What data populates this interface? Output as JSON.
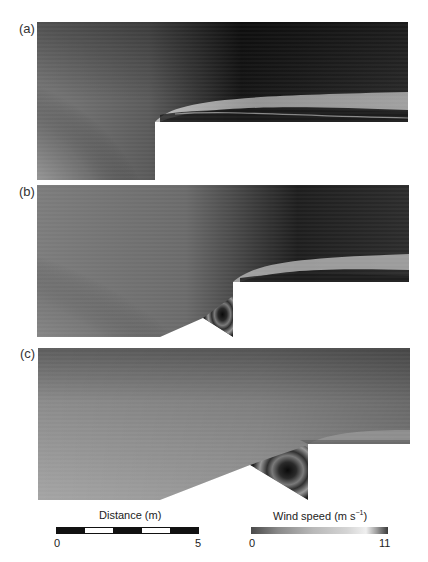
{
  "figure": {
    "panels": [
      {
        "label": "(a)",
        "description": "Wind speed field over a forward-facing step (cliff)"
      },
      {
        "label": "(b)",
        "description": "Wind speed field over step with small ramp and recirculating triangular cavity"
      },
      {
        "label": "(c)",
        "description": "Wind speed field over step with longer ramp and larger triangular recirculation cavity"
      }
    ],
    "scale_bar": {
      "title": "Distance (m)",
      "min_label": "0",
      "max_label": "5",
      "segments": [
        "black",
        "white",
        "black",
        "white",
        "black"
      ]
    },
    "colorbar": {
      "title": "Wind speed (m s",
      "title_exponent": "−1",
      "title_close": ")",
      "min_label": "0",
      "max_label": "11",
      "colors": [
        "#4a4a4a",
        "#8a8a8a",
        "#b8b8b8",
        "#d4d4d4",
        "#f0f0f0",
        "#3a3a3a"
      ]
    }
  },
  "colors": {
    "dark": "#141414",
    "mid": "#8e8e8e",
    "light": "#c8c8c8",
    "background": "#ffffff"
  }
}
